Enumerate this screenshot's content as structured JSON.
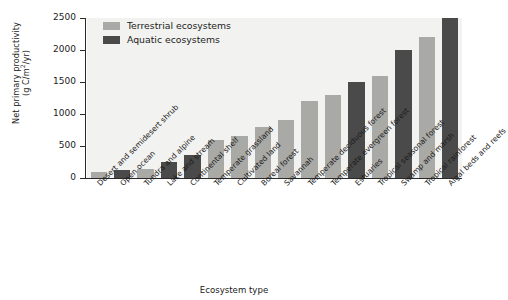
{
  "chart_data": {
    "type": "bar",
    "title": "",
    "xlabel": "Ecosystem type",
    "ylabel_line1": "Net primary productivity",
    "ylabel_line2_prefix": "(g C/m",
    "ylabel_line2_sup": "2",
    "ylabel_line2_suffix": "/yr)",
    "ylabel": "Net primary productivity (g C/m2/yr)",
    "ylim": [
      0,
      2500
    ],
    "yticks": [
      0,
      500,
      1000,
      1500,
      2000,
      2500
    ],
    "ytick_labels": [
      "0",
      "500",
      "1000",
      "1500",
      "2000",
      "2500"
    ],
    "grid": false,
    "legend_position": "top-left",
    "legend": [
      {
        "name": "Terrestrial ecosystems",
        "color": "#a9a9a6"
      },
      {
        "name": "Aquatic ecosystems",
        "color": "#4a4a4a"
      }
    ],
    "categories": [
      "Desert and semidesert shrub",
      "Open ocean",
      "Tundra and alpine",
      "Lake and stream",
      "Continental shelf",
      "Temperate grassland",
      "Cultivated land",
      "Boreal forest",
      "Savannah",
      "Temperate deciduous forest",
      "Temperate evergreen forest",
      "Estuaries",
      "Tropical seasonal forest",
      "Swamp and marsh",
      "Tropical rainforest",
      "Algal beds and reefs"
    ],
    "values": [
      90,
      125,
      140,
      250,
      360,
      600,
      650,
      800,
      900,
      1200,
      1300,
      1500,
      1600,
      2000,
      2200,
      2500
    ],
    "group": [
      "Terrestrial",
      "Aquatic",
      "Terrestrial",
      "Aquatic",
      "Aquatic",
      "Terrestrial",
      "Terrestrial",
      "Terrestrial",
      "Terrestrial",
      "Terrestrial",
      "Terrestrial",
      "Aquatic",
      "Terrestrial",
      "Aquatic",
      "Terrestrial",
      "Aquatic"
    ],
    "series": [
      {
        "name": "Terrestrial ecosystems",
        "color": "#a9a9a6",
        "points": [
          {
            "category": "Desert and semidesert shrub",
            "value": 90
          },
          {
            "category": "Tundra and alpine",
            "value": 140
          },
          {
            "category": "Temperate grassland",
            "value": 600
          },
          {
            "category": "Cultivated land",
            "value": 650
          },
          {
            "category": "Boreal forest",
            "value": 800
          },
          {
            "category": "Savannah",
            "value": 900
          },
          {
            "category": "Temperate deciduous forest",
            "value": 1200
          },
          {
            "category": "Temperate evergreen forest",
            "value": 1300
          },
          {
            "category": "Tropical seasonal forest",
            "value": 1600
          },
          {
            "category": "Tropical rainforest",
            "value": 2200
          }
        ]
      },
      {
        "name": "Aquatic ecosystems",
        "color": "#4a4a4a",
        "points": [
          {
            "category": "Open ocean",
            "value": 125
          },
          {
            "category": "Lake and stream",
            "value": 250
          },
          {
            "category": "Continental shelf",
            "value": 360
          },
          {
            "category": "Estuaries",
            "value": 1500
          },
          {
            "category": "Swamp and marsh",
            "value": 2000
          },
          {
            "category": "Algal beds and reefs",
            "value": 2500
          }
        ]
      }
    ],
    "colors": {
      "terrestrial": "#a9a9a6",
      "aquatic": "#4a4a4a",
      "plot_background": "#f2f2f0",
      "axis": "#2a2a2a",
      "text": "#1b1b1b"
    }
  }
}
